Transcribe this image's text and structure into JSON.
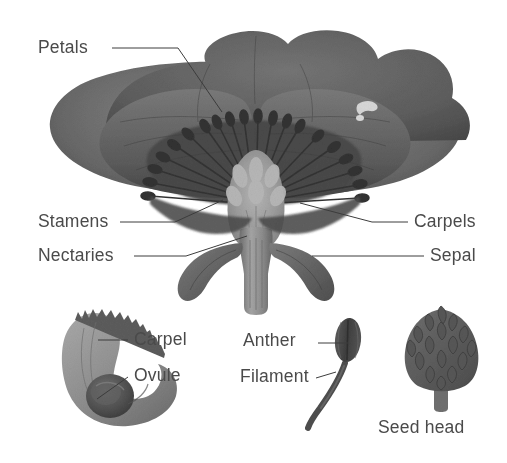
{
  "figure": {
    "background_color": "#ffffff",
    "label_color": "#4a4a4a",
    "leader_line_color": "#3c3c3c",
    "width": 507,
    "height": 463
  },
  "palette": {
    "petal_light": "#7b7b7b",
    "petal_mid": "#636363",
    "petal_dark": "#4f4f4f",
    "petal_darkest": "#3f3f3f",
    "stamen_dark": "#3a3a3a",
    "carpel_light": "#a9a9a9",
    "carpel_mid": "#8e8e8e",
    "sepal": "#6d6d6d",
    "stem": "#8a8a8a",
    "ovule_dark": "#4d4d4d",
    "seedhead": "#606060",
    "anther": "#4a4a4a",
    "highlight": "#e8e8e8"
  },
  "labels": [
    {
      "id": "petals",
      "text": "Petals",
      "x": 38,
      "y": 38,
      "align": "left"
    },
    {
      "id": "stamens",
      "text": "Stamens",
      "x": 38,
      "y": 212,
      "align": "left"
    },
    {
      "id": "nectaries",
      "text": "Nectaries",
      "x": 38,
      "y": 246,
      "align": "left"
    },
    {
      "id": "carpels",
      "text": "Carpels",
      "x": 414,
      "y": 212,
      "align": "left"
    },
    {
      "id": "sepal",
      "text": "Sepal",
      "x": 430,
      "y": 246,
      "align": "left"
    },
    {
      "id": "carpel",
      "text": "Carpel",
      "x": 134,
      "y": 330,
      "align": "left"
    },
    {
      "id": "ovule",
      "text": "Ovule",
      "x": 134,
      "y": 366,
      "align": "left"
    },
    {
      "id": "anther",
      "text": "Anther",
      "x": 243,
      "y": 331,
      "align": "left"
    },
    {
      "id": "filament",
      "text": "Filament",
      "x": 240,
      "y": 367,
      "align": "left"
    },
    {
      "id": "seed-head",
      "text": "Seed head",
      "x": 378,
      "y": 418,
      "align": "left"
    }
  ],
  "leader_lines": [
    {
      "id": "petals-leader",
      "points": "112,48 178,48 222,112"
    },
    {
      "id": "stamens-leader",
      "points": "120,222 175,222 223,200"
    },
    {
      "id": "nectaries-leader",
      "points": "134,256 186,256 247,236"
    },
    {
      "id": "carpels-leader",
      "points": "408,222 372,222 300,203"
    },
    {
      "id": "sepal-leader",
      "points": "424,256 312,256"
    },
    {
      "id": "carpel-leader",
      "points": "128,340 98,340"
    },
    {
      "id": "ovule-leader",
      "points": "128,377 97,399"
    },
    {
      "id": "anther-leader",
      "points": "318,343 348,343"
    },
    {
      "id": "filament-leader",
      "points": "316,378 336,372"
    }
  ],
  "parts": [
    {
      "id": "flower-head",
      "name": "Poppy flower cross-section with spread petals"
    },
    {
      "id": "stamen-ring",
      "name": "Ring of stamens radiating from flower center"
    },
    {
      "id": "central-carpel",
      "name": "Central carpel cluster (ovary)"
    },
    {
      "id": "sepals",
      "name": "Two curved sepals below flower"
    },
    {
      "id": "pedicel",
      "name": "Flower stem / pedicel"
    },
    {
      "id": "carpel-detail",
      "name": "Isolated carpel with ovule, lower left"
    },
    {
      "id": "stamen-detail",
      "name": "Isolated stamen with anther and filament"
    },
    {
      "id": "seedhead-art",
      "name": "Seed head cone with overlapping scales"
    }
  ]
}
